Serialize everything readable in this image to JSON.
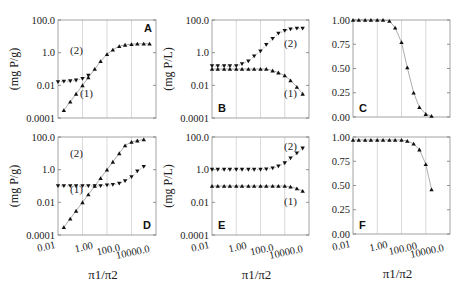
{
  "figure": {
    "x_axis_label": "π1/π2",
    "x_tick_labels": [
      "0.01",
      "1.00",
      "100.0",
      "10000.0"
    ],
    "x_tick_labels_F": [
      "0.01",
      "1.00",
      "100.00",
      "10000.0"
    ],
    "y_tick_labels_log": [
      "100.0",
      "1.0",
      "0.01",
      "0.0001"
    ],
    "y_tick_labels_lin": [
      "1.00",
      "0.75",
      "0.50",
      "0.25",
      "0.00"
    ]
  },
  "chart_data": [
    {
      "panel": "A",
      "type": "line",
      "yscale": "log",
      "xscale": "log",
      "ylabel": "(mg P/g)",
      "xlabel": "",
      "xlim": [
        0.01,
        1000000
      ],
      "ylim": [
        0.0001,
        100
      ],
      "series": [
        {
          "name": "(1)",
          "marker": "triangle-up",
          "x": [
            0.03,
            0.1,
            0.3,
            1,
            3,
            10,
            30,
            100,
            300,
            1000,
            3000,
            10000,
            30000,
            100000,
            300000
          ],
          "values": [
            0.0003,
            0.001,
            0.003,
            0.01,
            0.03,
            0.1,
            0.3,
            0.8,
            1.5,
            2.5,
            3,
            3.3,
            3.5,
            3.5,
            3.5
          ]
        },
        {
          "name": "(2)",
          "marker": "triangle-down",
          "x": [
            0.01,
            0.03,
            0.1,
            0.3,
            1,
            3
          ],
          "values": [
            0.016,
            0.017,
            0.018,
            0.02,
            0.025,
            0.04
          ]
        }
      ],
      "annotations": [
        "(2)",
        "(1)",
        "A"
      ]
    },
    {
      "panel": "B",
      "type": "line",
      "yscale": "log",
      "xscale": "log",
      "ylabel": "(mg P/L)",
      "xlabel": "",
      "xlim": [
        0.01,
        1000000
      ],
      "ylim": [
        0.0001,
        100
      ],
      "series": [
        {
          "name": "(1)",
          "marker": "triangle-up",
          "x": [
            0.01,
            0.03,
            0.1,
            0.3,
            1,
            3,
            10,
            30,
            100,
            300,
            1000,
            3000,
            10000,
            30000,
            100000,
            300000
          ],
          "values": [
            0.1,
            0.1,
            0.1,
            0.1,
            0.1,
            0.1,
            0.1,
            0.1,
            0.1,
            0.1,
            0.08,
            0.06,
            0.04,
            0.02,
            0.008,
            0.003
          ]
        },
        {
          "name": "(2)",
          "marker": "triangle-down",
          "x": [
            0.01,
            0.03,
            0.1,
            0.3,
            1,
            3,
            10,
            30,
            100,
            300,
            1000,
            3000,
            10000,
            30000,
            100000,
            300000
          ],
          "values": [
            0.15,
            0.15,
            0.15,
            0.15,
            0.15,
            0.2,
            0.3,
            0.6,
            1.2,
            3,
            7,
            15,
            22,
            27,
            30,
            30
          ]
        }
      ],
      "annotations": [
        "(2)",
        "(1)",
        "B"
      ]
    },
    {
      "panel": "C",
      "type": "line",
      "yscale": "linear",
      "xscale": "log",
      "ylabel": "",
      "xlabel": "",
      "xlim": [
        0.01,
        1000000
      ],
      "ylim": [
        0,
        1
      ],
      "series": [
        {
          "name": "fraction",
          "marker": "triangle-up",
          "x": [
            0.01,
            0.03,
            0.1,
            0.3,
            1,
            3,
            10,
            30,
            100,
            300,
            1000,
            3000,
            10000,
            30000
          ],
          "values": [
            1.0,
            1.0,
            1.0,
            1.0,
            1.0,
            1.0,
            0.99,
            0.92,
            0.77,
            0.51,
            0.25,
            0.1,
            0.03,
            0.01
          ]
        }
      ],
      "annotations": [
        "C"
      ]
    },
    {
      "panel": "D",
      "type": "line",
      "yscale": "log",
      "xscale": "log",
      "ylabel": "(mg P/g)",
      "xlabel": "π1/π2",
      "xlim": [
        0.01,
        1000000
      ],
      "ylim": [
        0.0001,
        100
      ],
      "series": [
        {
          "name": "(1)",
          "marker": "triangle-up",
          "x": [
            0.03,
            0.1,
            0.3,
            1,
            3,
            10,
            30,
            100,
            300,
            1000,
            3000,
            10000,
            30000,
            100000
          ],
          "values": [
            0.0003,
            0.001,
            0.003,
            0.01,
            0.03,
            0.1,
            0.3,
            1,
            3,
            10,
            30,
            50,
            60,
            70
          ]
        },
        {
          "name": "(2)",
          "marker": "triangle-down",
          "x": [
            0.01,
            0.03,
            0.1,
            0.3,
            1,
            3,
            10,
            30,
            100,
            300,
            1000,
            3000,
            10000,
            30000,
            100000
          ],
          "values": [
            0.1,
            0.1,
            0.1,
            0.1,
            0.1,
            0.1,
            0.1,
            0.1,
            0.11,
            0.12,
            0.14,
            0.2,
            0.35,
            0.8,
            1.5
          ]
        }
      ],
      "annotations": [
        "(2)",
        "(1)",
        "D"
      ]
    },
    {
      "panel": "E",
      "type": "line",
      "yscale": "log",
      "xscale": "log",
      "ylabel": "(mg P/L)",
      "xlabel": "π1/π2",
      "xlim": [
        0.01,
        1000000
      ],
      "ylim": [
        0.0001,
        100
      ],
      "series": [
        {
          "name": "(1)",
          "marker": "triangle-up",
          "x": [
            0.01,
            0.03,
            0.1,
            0.3,
            1,
            3,
            10,
            30,
            100,
            300,
            1000,
            3000,
            10000,
            30000,
            100000,
            300000
          ],
          "values": [
            0.1,
            0.1,
            0.1,
            0.1,
            0.1,
            0.1,
            0.1,
            0.1,
            0.1,
            0.1,
            0.1,
            0.1,
            0.1,
            0.09,
            0.07,
            0.05
          ]
        },
        {
          "name": "(2)",
          "marker": "triangle-down",
          "x": [
            0.01,
            0.03,
            0.1,
            0.3,
            1,
            3,
            10,
            30,
            100,
            300,
            1000,
            3000,
            10000,
            30000,
            100000,
            300000
          ],
          "values": [
            1,
            1,
            1,
            1,
            1,
            1,
            1,
            1,
            1,
            1.05,
            1.2,
            1.6,
            2.5,
            5,
            10,
            20
          ]
        }
      ],
      "annotations": [
        "(2)",
        "(1)",
        "E"
      ]
    },
    {
      "panel": "F",
      "type": "line",
      "yscale": "linear",
      "xscale": "log",
      "ylabel": "",
      "xlabel": "π1/π2",
      "xlim": [
        0.01,
        1000000
      ],
      "ylim": [
        0,
        1
      ],
      "series": [
        {
          "name": "fraction",
          "marker": "triangle-up",
          "x": [
            0.01,
            0.03,
            0.1,
            0.3,
            1,
            3,
            10,
            30,
            100,
            300,
            1000,
            3000,
            10000,
            30000
          ],
          "values": [
            0.97,
            0.97,
            0.97,
            0.97,
            0.97,
            0.97,
            0.97,
            0.97,
            0.97,
            0.96,
            0.93,
            0.87,
            0.72,
            0.46
          ]
        }
      ],
      "annotations": [
        "F"
      ]
    }
  ]
}
